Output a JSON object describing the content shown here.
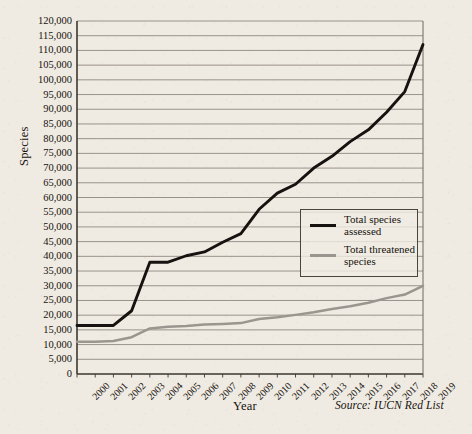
{
  "chart_data": {
    "type": "line",
    "title": "",
    "xlabel": "Year",
    "ylabel": "Species",
    "source": "Source: IUCN Red List",
    "grid": true,
    "legend_position": "inside-right",
    "xlim": [
      2000,
      2019
    ],
    "ylim": [
      0,
      120000
    ],
    "ytick_step": 5000,
    "x": [
      2000,
      2001,
      2002,
      2003,
      2004,
      2005,
      2006,
      2007,
      2008,
      2009,
      2010,
      2011,
      2012,
      2013,
      2014,
      2015,
      2016,
      2017,
      2018,
      2019
    ],
    "categories": [
      "2000",
      "2001",
      "2002",
      "2003",
      "2004",
      "2005",
      "2006",
      "2007",
      "2008",
      "2009",
      "2010",
      "2011",
      "2012",
      "2013",
      "2014",
      "2015",
      "2016",
      "2017",
      "2018",
      "2019"
    ],
    "ytick_labels": [
      "0",
      "5,000",
      "10,000",
      "15,000",
      "20,000",
      "25,000",
      "30,000",
      "35,000",
      "40,000",
      "45,000",
      "50,000",
      "55,000",
      "60,000",
      "65,000",
      "70,000",
      "75,000",
      "80,000",
      "85,000",
      "90,000",
      "95,000",
      "100,000",
      "105,000",
      "110,000",
      "115,000",
      "120,000"
    ],
    "ytick_values": [
      0,
      5000,
      10000,
      15000,
      20000,
      25000,
      30000,
      35000,
      40000,
      45000,
      50000,
      55000,
      60000,
      65000,
      70000,
      75000,
      80000,
      85000,
      90000,
      95000,
      100000,
      105000,
      110000,
      115000,
      120000
    ],
    "series": [
      {
        "name": "Total species assessed",
        "color": "#15120f",
        "values": [
          16500,
          16500,
          16500,
          21500,
          38000,
          38000,
          40200,
          41500,
          44800,
          47700,
          56000,
          61500,
          64500,
          70000,
          74000,
          79000,
          83000,
          89000,
          96000,
          112000
        ]
      },
      {
        "name": "Total threatened species",
        "color": "#9a958e",
        "values": [
          11000,
          11000,
          11200,
          12500,
          15500,
          16100,
          16300,
          16800,
          17000,
          17300,
          18700,
          19300,
          20100,
          21000,
          22100,
          23000,
          24200,
          25800,
          27000,
          30000
        ]
      }
    ]
  },
  "legend": {
    "entries": [
      {
        "label_line1": "Total species",
        "label_line2": "assessed"
      },
      {
        "label_line1": "Total threatened",
        "label_line2": "species"
      }
    ]
  },
  "colors": {
    "background": "#efebe3",
    "axis": "#3c362f",
    "gridline": "#8e8880",
    "text": "#16120d",
    "series_assessed": "#15120f",
    "series_threatened": "#9a958e"
  }
}
